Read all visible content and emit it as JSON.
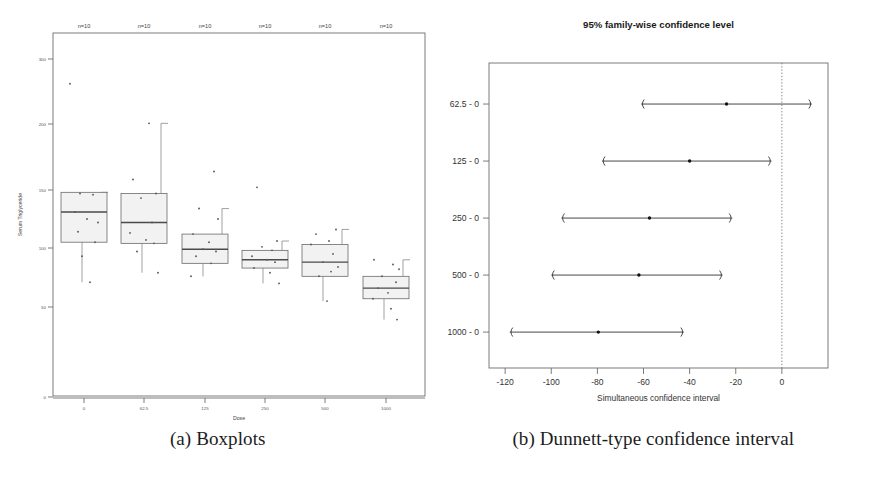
{
  "figure": {
    "captions": [
      {
        "id": "a",
        "text": "(a) Boxplots"
      },
      {
        "id": "b",
        "text": "(b) Dunnett-type confidence interval"
      }
    ]
  },
  "chart_data": [
    {
      "type": "bar",
      "subtype": "boxplot-with-points",
      "panel": "a",
      "title": "",
      "xlabel": "Dose",
      "ylabel": "Serum Triglyceride",
      "categories": [
        "0",
        "62.5",
        "125",
        "250",
        "500",
        "1000"
      ],
      "group_annotations": [
        "n=10",
        "n=10",
        "n=10",
        "n=10",
        "n=10",
        "n=10"
      ],
      "xtick_labels": [
        "0",
        "62.5",
        "125",
        "250",
        "500",
        "1000"
      ],
      "ytick_labels": [
        "300",
        "200",
        "150",
        "100",
        "50",
        "0"
      ],
      "ytick_values": [
        300,
        200,
        150,
        100,
        50,
        0
      ],
      "yscale": "log-like",
      "grid": false,
      "legend": "none",
      "boxes": [
        {
          "category": "0",
          "lower_whisker": 71,
          "q1": 105,
          "median": 131,
          "q3": 148,
          "upper_whisker": 148,
          "points": [
            262,
            147,
            146,
            131,
            125,
            122,
            114,
            105,
            93,
            71
          ]
        },
        {
          "category": "62.5",
          "lower_whisker": 79,
          "q1": 104,
          "median": 122,
          "q3": 147,
          "upper_whisker": 201,
          "points": [
            201,
            158,
            147,
            143,
            122,
            113,
            107,
            104,
            97,
            79
          ]
        },
        {
          "category": "125",
          "lower_whisker": 76,
          "q1": 87,
          "median": 99,
          "q3": 112,
          "upper_whisker": 134,
          "points": [
            164,
            134,
            125,
            112,
            105,
            99,
            97,
            93,
            87,
            76
          ]
        },
        {
          "category": "250",
          "lower_whisker": 70,
          "q1": 83,
          "median": 90,
          "q3": 98,
          "upper_whisker": 106,
          "points": [
            152,
            106,
            101,
            98,
            93,
            90,
            88,
            83,
            79,
            70
          ]
        },
        {
          "category": "500",
          "lower_whisker": 55,
          "q1": 76,
          "median": 88,
          "q3": 103,
          "upper_whisker": 116,
          "points": [
            116,
            112,
            106,
            103,
            95,
            88,
            84,
            80,
            76,
            55
          ]
        },
        {
          "category": "1000",
          "lower_whisker": 43,
          "q1": 57,
          "median": 66,
          "q3": 76,
          "upper_whisker": 90,
          "points": [
            90,
            86,
            82,
            76,
            71,
            66,
            62,
            57,
            49,
            43
          ]
        }
      ]
    },
    {
      "type": "scatter",
      "subtype": "confidence-interval-dotplot",
      "panel": "b",
      "title": "95% family-wise confidence level",
      "xlabel": "Simultaneous confidence interval",
      "ylabel": "",
      "xtick_labels": [
        "-120",
        "-100",
        "-80",
        "-60",
        "-40",
        "-20",
        "0"
      ],
      "xtick_values": [
        -120,
        -100,
        -80,
        -60,
        -40,
        -20,
        0
      ],
      "xlim": [
        -127,
        20
      ],
      "grid": false,
      "legend": "none",
      "reference_line": 0,
      "comparisons": [
        {
          "label": "62.5 - 0",
          "estimate": -24.0,
          "lower": -61.0,
          "upper": 13.0
        },
        {
          "label": "125 - 0",
          "estimate": -40.0,
          "lower": -78.0,
          "upper": -4.5
        },
        {
          "label": "250 - 0",
          "estimate": -57.4,
          "lower": -95.6,
          "upper": -21.5
        },
        {
          "label": "500 - 0",
          "estimate": -62.0,
          "lower": -100.0,
          "upper": -25.7
        },
        {
          "label": "1000 - 0",
          "estimate": -79.6,
          "lower": -118.0,
          "upper": -42.5
        }
      ]
    }
  ]
}
